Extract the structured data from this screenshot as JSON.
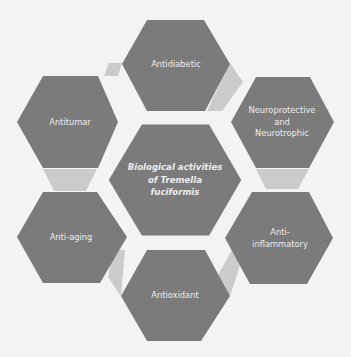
{
  "diagram": {
    "center": {
      "lines": [
        "Biological activities",
        "of Tremella",
        "fuciformis"
      ]
    },
    "activities": [
      {
        "id": "antidiabetic",
        "lines": [
          "Antidiabetic"
        ]
      },
      {
        "id": "neuroprotective",
        "lines": [
          "Neuroprotective",
          "and",
          "Neurotrophic"
        ]
      },
      {
        "id": "anti-inflammatory",
        "lines": [
          "Anti-",
          "inflammatory"
        ]
      },
      {
        "id": "antioxidant",
        "lines": [
          "Antioxidant"
        ]
      },
      {
        "id": "anti-aging",
        "lines": [
          "Anti-aging"
        ]
      },
      {
        "id": "antitumar",
        "lines": [
          "Antitumar"
        ]
      }
    ],
    "colors": {
      "hex_fill": "#7b7b7b",
      "connector_fill": "#cbcbcb",
      "background": "#f3f3f2",
      "text": "#ececec"
    }
  }
}
